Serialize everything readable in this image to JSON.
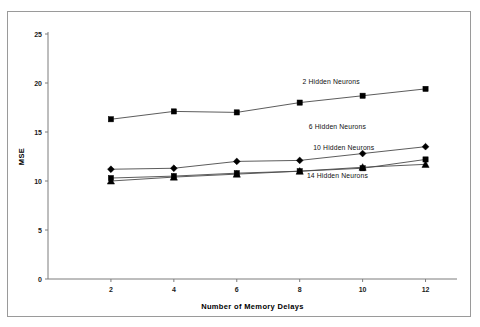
{
  "scan": {
    "top_strip_ghost_text": "·      ·                             ·          ·"
  },
  "chart_data": {
    "type": "line",
    "title": "",
    "xlabel": "Number of Memory Delays",
    "ylabel": "MSE",
    "x": [
      2,
      4,
      6,
      8,
      10,
      12
    ],
    "xlim": [
      0,
      13
    ],
    "ylim": [
      0,
      25
    ],
    "xticks": [
      2,
      4,
      6,
      8,
      10,
      12
    ],
    "yticks": [
      0,
      5,
      10,
      15,
      20,
      25
    ],
    "xticklabels": [
      "2",
      "4",
      "6",
      "8",
      "10",
      "12"
    ],
    "yticklabels": [
      "0",
      "5",
      "10",
      "15",
      "20",
      "25"
    ],
    "grid": false,
    "legend": "inline-annotations",
    "series": [
      {
        "name": "2 Hidden Neurons",
        "label": "2 Hidden Neurons",
        "marker": "square",
        "values": [
          16.3,
          17.1,
          17.0,
          18.0,
          18.7,
          19.4
        ],
        "label_x": 9.0,
        "label_y": 19.9
      },
      {
        "name": "6 Hidden Neurons",
        "label": "6 Hidden Neurons",
        "marker": "diamond",
        "values": [
          11.2,
          11.3,
          12.0,
          12.1,
          12.8,
          13.5
        ],
        "label_x": 9.2,
        "label_y": 15.3
      },
      {
        "name": "10 Hidden Neurons",
        "label": "10 Hidden Neurons",
        "marker": "square",
        "values": [
          10.3,
          10.5,
          10.8,
          11.0,
          11.3,
          12.2
        ],
        "label_x": 9.4,
        "label_y": 13.2
      },
      {
        "name": "14 Hidden Neurons",
        "label": "14 Hidden Neurons",
        "marker": "triangle",
        "values": [
          10.0,
          10.4,
          10.7,
          11.0,
          11.4,
          11.7
        ],
        "label_x": 9.2,
        "label_y": 10.3
      }
    ]
  }
}
